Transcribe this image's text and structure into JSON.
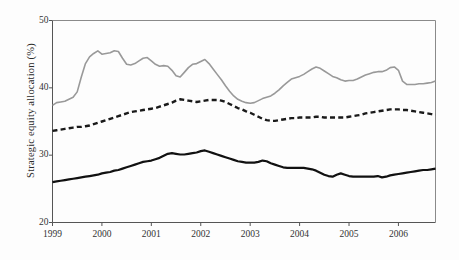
{
  "chart_data": {
    "type": "line",
    "title": "",
    "subtitle": "",
    "xlabel": "",
    "ylabel": "Strategic equity allocation (%)",
    "xlim": [
      1999.0,
      2006.75
    ],
    "ylim": [
      20,
      50
    ],
    "xticks": [
      1999,
      2000,
      2001,
      2002,
      2003,
      2004,
      2005,
      2006
    ],
    "xtick_labels": [
      "1999",
      "2000",
      "2001",
      "2002",
      "2003",
      "2004",
      "2005",
      "2006"
    ],
    "yticks": [
      20,
      30,
      40,
      50
    ],
    "ytick_labels": [
      "20",
      "30",
      "40",
      "50"
    ],
    "grid": false,
    "legend": "none",
    "frame": "box",
    "x": [
      1999.0,
      1999.083,
      1999.167,
      1999.25,
      1999.333,
      1999.417,
      1999.5,
      1999.583,
      1999.667,
      1999.75,
      1999.833,
      1999.917,
      2000.0,
      2000.083,
      2000.167,
      2000.25,
      2000.333,
      2000.417,
      2000.5,
      2000.583,
      2000.667,
      2000.75,
      2000.833,
      2000.917,
      2001.0,
      2001.083,
      2001.167,
      2001.25,
      2001.333,
      2001.417,
      2001.5,
      2001.583,
      2001.667,
      2001.75,
      2001.833,
      2001.917,
      2002.0,
      2002.083,
      2002.167,
      2002.25,
      2002.333,
      2002.417,
      2002.5,
      2002.583,
      2002.667,
      2002.75,
      2002.833,
      2002.917,
      2003.0,
      2003.083,
      2003.167,
      2003.25,
      2003.333,
      2003.417,
      2003.5,
      2003.583,
      2003.667,
      2003.75,
      2003.833,
      2003.917,
      2004.0,
      2004.083,
      2004.167,
      2004.25,
      2004.333,
      2004.417,
      2004.5,
      2004.583,
      2004.667,
      2004.75,
      2004.833,
      2004.917,
      2005.0,
      2005.083,
      2005.167,
      2005.25,
      2005.333,
      2005.417,
      2005.5,
      2005.583,
      2005.667,
      2005.75,
      2005.833,
      2005.917,
      2006.0,
      2006.083,
      2006.167,
      2006.25,
      2006.333,
      2006.417,
      2006.5,
      2006.583,
      2006.667,
      2006.75
    ],
    "series": [
      {
        "name": "upper-gray",
        "style": "solid",
        "color": "#999999",
        "width": 1.6,
        "values": [
          37.4,
          37.8,
          37.9,
          38.0,
          38.3,
          38.6,
          39.4,
          41.6,
          43.6,
          44.6,
          45.1,
          45.5,
          45.0,
          45.1,
          45.2,
          45.5,
          45.4,
          44.4,
          43.5,
          43.4,
          43.6,
          44.0,
          44.4,
          44.5,
          44.0,
          43.5,
          43.2,
          43.3,
          43.2,
          42.6,
          41.8,
          41.6,
          42.3,
          43.0,
          43.5,
          43.6,
          43.9,
          44.2,
          43.6,
          42.8,
          42.0,
          41.2,
          40.3,
          39.5,
          38.8,
          38.3,
          38.0,
          37.8,
          37.7,
          37.8,
          38.1,
          38.4,
          38.6,
          38.8,
          39.2,
          39.7,
          40.3,
          40.8,
          41.3,
          41.5,
          41.7,
          42.0,
          42.4,
          42.8,
          43.1,
          42.9,
          42.5,
          42.1,
          41.7,
          41.5,
          41.2,
          41.0,
          41.1,
          41.1,
          41.3,
          41.6,
          41.9,
          42.1,
          42.3,
          42.4,
          42.4,
          42.6,
          43.0,
          43.1,
          42.6,
          41.0,
          40.5,
          40.5,
          40.5,
          40.6,
          40.6,
          40.7,
          40.8,
          41.0
        ]
      },
      {
        "name": "middle-dashed",
        "style": "dashed",
        "color": "#1a1a1a",
        "width": 2.4,
        "values": [
          33.6,
          33.7,
          33.8,
          33.9,
          34.0,
          34.1,
          34.2,
          34.2,
          34.3,
          34.4,
          34.6,
          34.8,
          35.0,
          35.2,
          35.4,
          35.6,
          35.8,
          36.0,
          36.2,
          36.4,
          36.5,
          36.6,
          36.7,
          36.8,
          36.9,
          37.0,
          37.2,
          37.4,
          37.6,
          37.8,
          38.1,
          38.3,
          38.2,
          38.1,
          38.0,
          37.9,
          38.0,
          38.1,
          38.2,
          38.2,
          38.2,
          38.1,
          37.9,
          37.6,
          37.3,
          37.0,
          36.8,
          36.5,
          36.3,
          36.0,
          35.7,
          35.4,
          35.2,
          35.1,
          35.1,
          35.2,
          35.3,
          35.4,
          35.5,
          35.5,
          35.6,
          35.6,
          35.6,
          35.6,
          35.7,
          35.7,
          35.6,
          35.6,
          35.6,
          35.6,
          35.6,
          35.6,
          35.7,
          35.8,
          35.9,
          36.0,
          36.2,
          36.3,
          36.4,
          36.5,
          36.6,
          36.7,
          36.8,
          36.8,
          36.8,
          36.7,
          36.7,
          36.6,
          36.5,
          36.4,
          36.3,
          36.2,
          36.1,
          36.0
        ]
      },
      {
        "name": "lower-black",
        "style": "solid",
        "color": "#111111",
        "width": 2.2,
        "values": [
          26.0,
          26.1,
          26.2,
          26.3,
          26.4,
          26.5,
          26.6,
          26.7,
          26.8,
          26.9,
          27.0,
          27.1,
          27.3,
          27.4,
          27.5,
          27.7,
          27.8,
          28.0,
          28.2,
          28.4,
          28.6,
          28.8,
          29.0,
          29.1,
          29.2,
          29.4,
          29.6,
          29.9,
          30.2,
          30.3,
          30.2,
          30.1,
          30.1,
          30.2,
          30.3,
          30.4,
          30.6,
          30.7,
          30.5,
          30.3,
          30.1,
          29.9,
          29.7,
          29.5,
          29.3,
          29.1,
          29.0,
          28.9,
          28.9,
          28.9,
          29.0,
          29.2,
          29.1,
          28.8,
          28.6,
          28.4,
          28.2,
          28.1,
          28.1,
          28.1,
          28.1,
          28.1,
          28.0,
          27.9,
          27.7,
          27.4,
          27.1,
          26.9,
          26.8,
          27.1,
          27.3,
          27.1,
          26.9,
          26.8,
          26.8,
          26.8,
          26.8,
          26.8,
          26.8,
          26.9,
          26.7,
          26.8,
          27.0,
          27.1,
          27.2,
          27.3,
          27.4,
          27.5,
          27.6,
          27.7,
          27.8,
          27.8,
          27.9,
          28.0
        ]
      }
    ]
  },
  "axes": {
    "y_axis_title": "Strategic equity allocation (%)"
  }
}
